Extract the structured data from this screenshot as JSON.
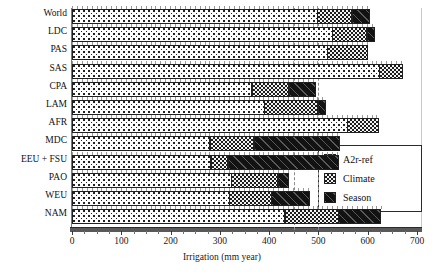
{
  "chart_data": {
    "type": "bar",
    "orientation": "horizontal",
    "stacked": true,
    "title": "",
    "xlabel": "Irrigation (mm year)",
    "ylabel": "",
    "xlim": [
      0,
      700
    ],
    "xticks": [
      0,
      100,
      200,
      300,
      400,
      500,
      600,
      700
    ],
    "xtick_labels": [
      "0",
      "100",
      "200",
      "300",
      "400",
      "500",
      "600",
      "700"
    ],
    "grid": false,
    "legend_position": "center-right",
    "categories": [
      "World",
      "LDC",
      "PAS",
      "SAS",
      "CPA",
      "LAM",
      "AFR",
      "MDC",
      "EEU + FSU",
      "PAO",
      "WEU",
      "NAM"
    ],
    "series": [
      {
        "name": "A2r-ref",
        "pattern": "dotted",
        "values": [
          499,
          529,
          519,
          625,
          366,
          391,
          559,
          281,
          283,
          324,
          320,
          433
        ]
      },
      {
        "name": "Climate",
        "pattern": "checker",
        "values": [
          71,
          71,
          83,
          47,
          76,
          110,
          66,
          90,
          35,
          96,
          87,
          110
        ]
      },
      {
        "name": "Season",
        "pattern": "black-hatch",
        "values": [
          38,
          17,
          0,
          0,
          55,
          16,
          0,
          176,
          227,
          23,
          79,
          87
        ]
      }
    ],
    "cumulative_totals": [
      608,
      617,
      602,
      672,
      497,
      517,
      625,
      547,
      545,
      443,
      486,
      630
    ],
    "reference_lines": [
      450,
      500
    ]
  },
  "legend": {
    "items": [
      {
        "label": "A2r-ref",
        "swatch": "dotted-swatch"
      },
      {
        "label": "Climate",
        "swatch": "checker-swatch"
      },
      {
        "label": "Season",
        "swatch": "black-swatch"
      }
    ]
  },
  "axis": {
    "x_title": "Irrigation (mm year)"
  }
}
